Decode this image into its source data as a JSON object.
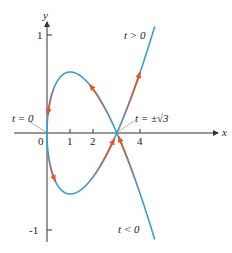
{
  "figure": {
    "colors": {
      "curve": "#3a9fd0",
      "arrow": "#e0562a",
      "axis": "#333333",
      "leader": "#d9a07a"
    },
    "axes": {
      "x_label": "x",
      "y_label": "y",
      "x_ticks": [
        "0",
        "1",
        "2",
        "4"
      ],
      "y_ticks": [
        "1",
        "-1"
      ]
    },
    "annotations": {
      "t_zero": "t = 0",
      "t_sqrt3": "t = ±√3",
      "t_positive": "t > 0",
      "t_negative": "t < 0"
    }
  }
}
